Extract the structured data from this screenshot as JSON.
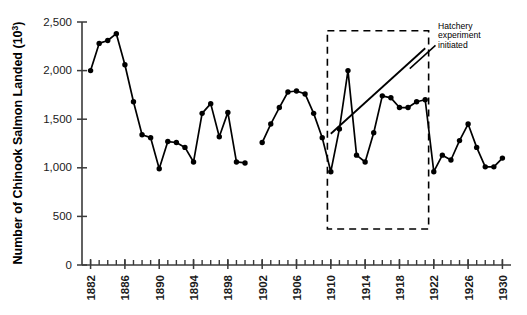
{
  "chart_data": {
    "type": "line",
    "title": "",
    "xlabel": "",
    "ylabel": "Number of Chinook Salmon Landed (10³)",
    "ylabel_plain": "Number of Chinook Salmon Landed (10",
    "ylabel_sup": "3",
    "ylabel_tail": ")",
    "xlim": [
      1881,
      1931
    ],
    "ylim": [
      0,
      2500
    ],
    "grid": false,
    "legend": null,
    "y_ticks": [
      0,
      500,
      1000,
      1500,
      2000,
      2500
    ],
    "y_tick_labels": [
      "0",
      "500",
      "1,000",
      "1,500",
      "2,000",
      "2,500"
    ],
    "x_ticks": [
      1882,
      1886,
      1890,
      1894,
      1898,
      1902,
      1906,
      1910,
      1914,
      1918,
      1922,
      1926,
      1930
    ],
    "x_tick_labels": [
      "1882",
      "1886",
      "1890",
      "1894",
      "1898",
      "1902",
      "1906",
      "1910",
      "1914",
      "1918",
      "1922",
      "1926",
      "1930"
    ],
    "x_minor_tick_step": 1,
    "x": [
      1882,
      1883,
      1884,
      1885,
      1886,
      1887,
      1888,
      1889,
      1890,
      1891,
      1892,
      1893,
      1894,
      1895,
      1896,
      1897,
      1898,
      1899,
      1900,
      1902,
      1903,
      1904,
      1905,
      1906,
      1907,
      1908,
      1909,
      1910,
      1911,
      1912,
      1913,
      1914,
      1915,
      1916,
      1917,
      1918,
      1919,
      1920,
      1921,
      1922,
      1923,
      1924,
      1925,
      1926,
      1927,
      1928,
      1929,
      1930
    ],
    "values": [
      2000,
      2280,
      2310,
      2380,
      2060,
      1680,
      1340,
      1310,
      990,
      1270,
      1260,
      1210,
      1060,
      1560,
      1660,
      1320,
      1570,
      1060,
      1050,
      1260,
      1450,
      1620,
      1780,
      1790,
      1760,
      1560,
      1310,
      960,
      1400,
      2000,
      1130,
      1060,
      1360,
      1740,
      1720,
      1620,
      1620,
      1680,
      1700,
      960,
      1130,
      1080,
      1280,
      1450,
      1210,
      1010,
      1010,
      1100
    ],
    "series": [
      {
        "name": "Chinook salmon landed",
        "marker": "filled-circle",
        "line_style": "solid",
        "color": "#000000"
      }
    ],
    "trend_line": {
      "name": "hatchery-period-trend",
      "x": [
        1910,
        1921
      ],
      "y": [
        1350,
        2230
      ],
      "color": "#000000",
      "line_style": "solid"
    },
    "highlight_box": {
      "name": "hatchery-experiment-period",
      "x_range": [
        1909.6,
        1921.4
      ],
      "y_range": [
        370,
        2410
      ],
      "line_style": "dashed",
      "color": "#000000"
    },
    "annotations": [
      {
        "name": "hatchery-annotation",
        "lines": [
          "Hatchery",
          "experiment",
          "initiated"
        ],
        "text": "Hatchery experiment initiated",
        "x": 1922.5,
        "y": 2430,
        "leader_from": [
          1919.2,
          2020
        ],
        "leader_to": [
          1922.2,
          2260
        ]
      }
    ]
  }
}
